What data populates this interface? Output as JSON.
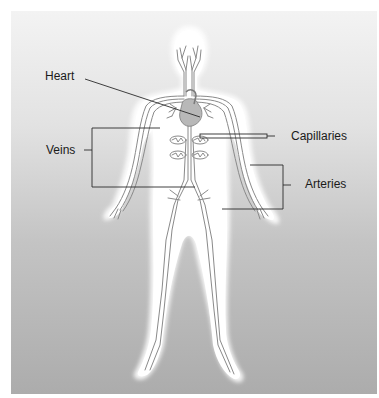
{
  "figure": {
    "background": {
      "top_color": "#f3f3f3",
      "bottom_color": "#acacac"
    },
    "body_fill": "#ffffff",
    "vessel_color": "#8a8a8a",
    "leader_color": "#2a2a2a"
  },
  "labels": {
    "heart": {
      "text": "Heart",
      "x": 45,
      "y": 69
    },
    "veins": {
      "text": "Veins",
      "x": 46,
      "y": 143
    },
    "capillaries": {
      "text": "Capillaries",
      "x": 291,
      "y": 129
    },
    "arteries": {
      "text": "Arteries",
      "x": 305,
      "y": 177
    }
  }
}
